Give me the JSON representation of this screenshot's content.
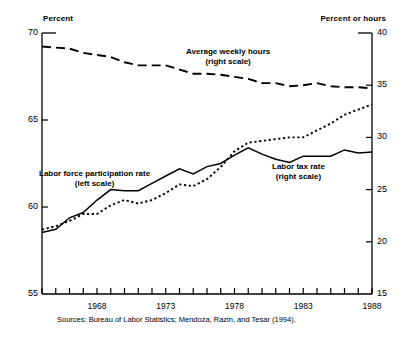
{
  "axes": {
    "left_title": "Percent",
    "right_title": "Percent or hours",
    "left_ticks": [
      "70",
      "65",
      "60",
      "55"
    ],
    "right_ticks": [
      "40",
      "35",
      "30",
      "25",
      "20",
      "15"
    ],
    "x_ticks": [
      "1968",
      "1973",
      "1978",
      "1983",
      "1988"
    ]
  },
  "labels": {
    "hours_line1": "Average weekly hours",
    "hours_line2": "(right scale)",
    "lfpr_line1": "Labor force participation rate",
    "lfpr_line2": "(left scale)",
    "tax_line1": "Labor tax rate",
    "tax_line2": "(right scale)"
  },
  "source": "Sources: Bureau of Labor Statistics; Mendoza, Razin, and Tesar (1994).",
  "colors": {
    "line": "#000000",
    "background": "#ffffff"
  },
  "chart_data": {
    "type": "line",
    "title": "",
    "xlabel": "",
    "ylabel": "Percent",
    "y2label": "Percent or hours",
    "xlim": [
      1964,
      1988
    ],
    "ylim": [
      55,
      70
    ],
    "y2lim": [
      15,
      40
    ],
    "grid": false,
    "legend": "inline-annotations",
    "x": [
      1964,
      1965,
      1966,
      1967,
      1968,
      1969,
      1970,
      1971,
      1972,
      1973,
      1974,
      1975,
      1976,
      1977,
      1978,
      1979,
      1980,
      1981,
      1982,
      1983,
      1984,
      1985,
      1986,
      1987,
      1988
    ],
    "series": [
      {
        "name": "Average weekly hours (right scale)",
        "axis": "right",
        "style": "dashed",
        "values": [
          38.7,
          38.6,
          38.5,
          38.1,
          37.9,
          37.7,
          37.2,
          36.9,
          36.9,
          36.9,
          36.5,
          36.1,
          36.1,
          36.0,
          35.8,
          35.6,
          35.2,
          35.2,
          34.9,
          35.0,
          35.2,
          34.9,
          34.8,
          34.8,
          34.7
        ]
      },
      {
        "name": "Labor force participation rate (left scale)",
        "axis": "left",
        "style": "dotted",
        "values": [
          58.7,
          58.9,
          59.2,
          59.6,
          59.6,
          60.1,
          60.4,
          60.2,
          60.4,
          60.8,
          61.3,
          61.2,
          61.6,
          62.3,
          63.2,
          63.7,
          63.8,
          63.9,
          64.0,
          64.0,
          64.4,
          64.8,
          65.3,
          65.6,
          65.9
        ]
      },
      {
        "name": "Labor tax rate (right scale)",
        "axis": "right",
        "style": "solid",
        "values": [
          20.9,
          21.2,
          22.3,
          22.8,
          24.0,
          25.0,
          24.9,
          24.9,
          25.6,
          26.3,
          27.0,
          26.5,
          27.2,
          27.5,
          28.3,
          29.0,
          28.4,
          27.9,
          27.6,
          28.2,
          28.2,
          28.2,
          28.8,
          28.5,
          28.6
        ]
      }
    ]
  }
}
